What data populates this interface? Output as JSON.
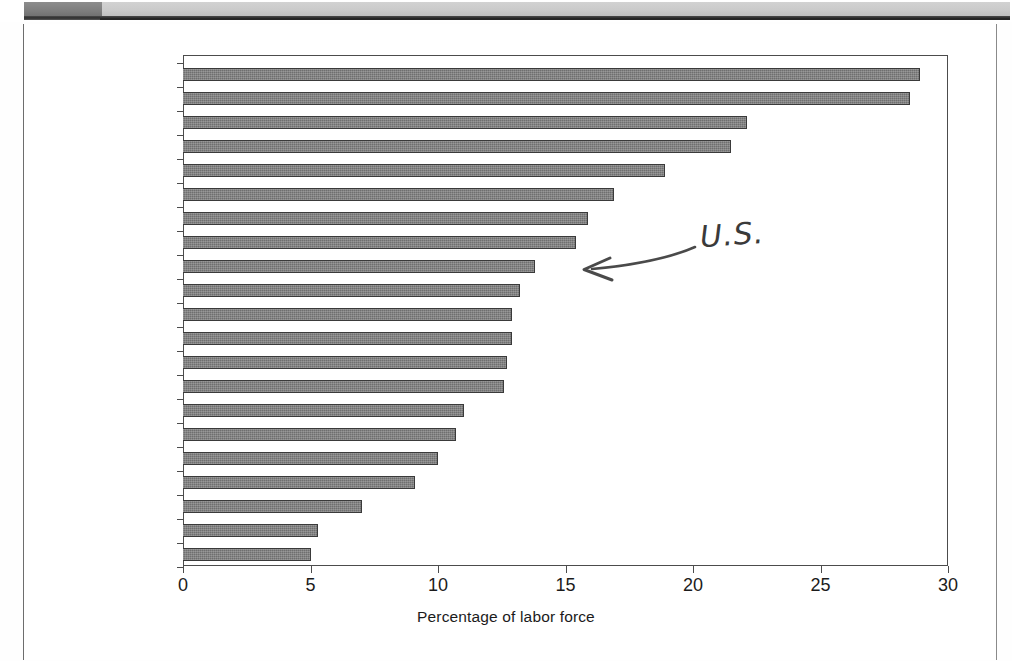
{
  "page": {
    "type": "scanned-book-page",
    "header_band_color": "#cacaca",
    "header_block_color": "#7d7d7d"
  },
  "annotation": {
    "text": "U.S.",
    "kind": "handwritten-note",
    "arrow": "left-pointing-curved-arrow",
    "points_to": "United States"
  },
  "chart_data": {
    "type": "bar",
    "orientation": "horizontal",
    "title": "",
    "xlabel": "Percentage of labor force",
    "ylabel": "",
    "xlim": [
      0,
      30
    ],
    "xticks": [
      0,
      5,
      10,
      15,
      20,
      25,
      30
    ],
    "xtick_labels": [
      "0",
      "5",
      "10",
      "15",
      "20",
      "25",
      "30"
    ],
    "grid": false,
    "legend": null,
    "bar_color": "#6f6f6f",
    "categories": [
      "Norway",
      "Sweden",
      "France",
      "Finland",
      "Hungary",
      "Belgium",
      "Canada",
      "Slovak Republic",
      "United States",
      "Australia",
      "Portugal",
      "Poland",
      "Netherlands",
      "Spain",
      "Mexico",
      "Germany",
      "Austria",
      "Turkey",
      "Switzerland",
      "Korea",
      "Japan"
    ],
    "values": [
      28.9,
      28.5,
      22.1,
      21.5,
      18.9,
      16.9,
      15.9,
      15.4,
      13.8,
      13.2,
      12.9,
      12.9,
      12.7,
      12.6,
      11.0,
      10.7,
      10.0,
      9.1,
      7.0,
      5.3,
      5.0
    ]
  }
}
